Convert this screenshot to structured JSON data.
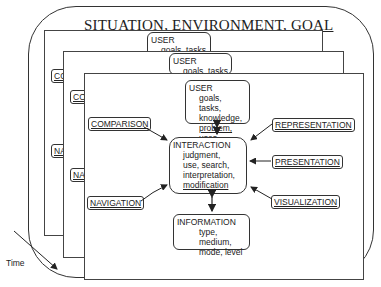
{
  "diagram": {
    "frame_title": "SITUATION, ENVIRONMENT, GOAL",
    "time_label": "Time",
    "back_layers": [
      {
        "user_heading": "USER",
        "user_line": "goals, tasks",
        "left_tags": [
          "CO",
          "NA"
        ]
      },
      {
        "user_heading": "USER",
        "user_line": "goals, tasks",
        "left_tags": [
          "CO",
          "NA"
        ]
      }
    ],
    "front_layer": {
      "user": {
        "heading": "USER",
        "lines": [
          "goals, tasks,",
          "knowledge,",
          "problem, uses"
        ]
      },
      "interaction": {
        "heading": "INTERACTION",
        "lines": [
          "judgment,",
          "use, search,",
          "interpretation,",
          "modification"
        ]
      },
      "information": {
        "heading": "INFORMATION",
        "lines": [
          "type, medium,",
          "mode, level"
        ]
      },
      "tags": {
        "comparison": "COMPARISON",
        "navigation": "NAVIGATION",
        "representation": "REPRESENTATION",
        "presentation": "PRESENTATION",
        "visualization": "VISUALIZATION"
      }
    }
  }
}
